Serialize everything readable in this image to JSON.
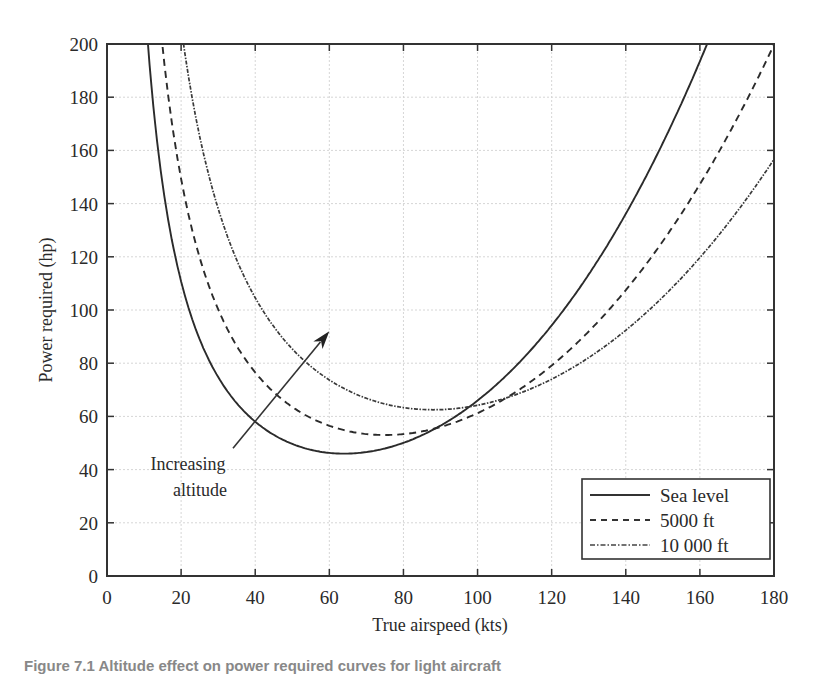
{
  "chart_data": {
    "type": "line",
    "title": "",
    "xlabel": "True airspeed (kts)",
    "ylabel": "Power required (hp)",
    "xlim": [
      0,
      180
    ],
    "ylim": [
      0,
      200
    ],
    "xticks": [
      0,
      20,
      40,
      60,
      80,
      100,
      120,
      140,
      160,
      180
    ],
    "yticks": [
      0,
      20,
      40,
      60,
      80,
      100,
      120,
      140,
      160,
      180,
      200
    ],
    "grid": true,
    "legend_position": "lower right",
    "series": [
      {
        "name": "Sea level",
        "style": "solid",
        "x": [
          11,
          15,
          20,
          25,
          30,
          35,
          40,
          45,
          50,
          55,
          60,
          64,
          70,
          75,
          80,
          85,
          90,
          95,
          100,
          110,
          120,
          130,
          140,
          150,
          160,
          163
        ],
        "y": [
          200.8,
          147.4,
          110.8,
          89.0,
          74.8,
          64.9,
          58.0,
          53.1,
          49.6,
          47.4,
          46.3,
          46.0,
          46.6,
          49.9,
          50.1,
          52.9,
          56.5,
          60.9,
          65.9,
          78.5,
          94.2,
          113.4,
          136.2,
          162.8,
          193.5,
          203.5
        ],
        "minimum": {
          "x": 64,
          "y": 46
        }
      },
      {
        "name": "5000 ft",
        "style": "dashed",
        "x": [
          15,
          20,
          25,
          30,
          35,
          40,
          45,
          50,
          55,
          60,
          65,
          70,
          75,
          80,
          85,
          90,
          95,
          100,
          110,
          120,
          130,
          140,
          150,
          160,
          170,
          180
        ],
        "y": [
          198.8,
          149.3,
          119.7,
          100.2,
          86.5,
          76.5,
          69.1,
          63.5,
          59.4,
          56.5,
          54.5,
          53.5,
          53.0,
          53.4,
          54.4,
          56.0,
          58.3,
          61.2,
          68.9,
          79.1,
          91.9,
          107.5,
          125.9,
          147.3,
          171.8,
          199.8
        ],
        "minimum": {
          "x": 75,
          "y": 53
        }
      },
      {
        "name": "10 000 ft",
        "style": "dash-dot",
        "x": [
          20,
          25,
          30,
          35,
          40,
          45,
          50,
          55,
          60,
          65,
          70,
          75,
          80,
          85,
          88,
          90,
          95,
          100,
          110,
          120,
          130,
          140,
          150,
          160,
          170,
          180
        ],
        "y": [
          206.4,
          165.4,
          138.1,
          118.8,
          104.6,
          93.8,
          85.4,
          78.8,
          73.7,
          69.8,
          66.8,
          64.7,
          63.3,
          62.6,
          62.5,
          62.5,
          63.1,
          64.2,
          67.0,
          72.0,
          82.1,
          92.4,
          106.9,
          121.7,
          136.9,
          156.6
        ],
        "minimum": {
          "x": 88,
          "y": 62.5
        }
      }
    ],
    "annotations": [
      {
        "text_line1": "Increasing",
        "text_line2": "altitude",
        "arrow_from": {
          "x": 34,
          "y": 48
        },
        "arrow_to": {
          "x": 60,
          "y": 92
        }
      }
    ]
  },
  "legend": {
    "items": [
      "Sea level",
      "5000 ft",
      "10 000 ft"
    ]
  },
  "caption": "Figure 7.1  Altitude effect on power required curves for light aircraft"
}
